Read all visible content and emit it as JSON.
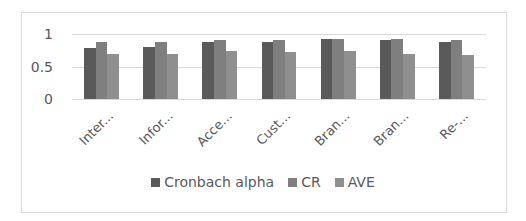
{
  "chart_data": {
    "type": "bar",
    "title": "",
    "xlabel": "",
    "ylabel": "",
    "ylim": [
      0,
      1
    ],
    "yticks": [
      "0",
      "0.5",
      "1"
    ],
    "grid": true,
    "legend_position": "bottom",
    "categories": [
      "Inter...",
      "Infor...",
      "Acce...",
      "Cust...",
      "Bran...",
      "Bran...",
      "Re-..."
    ],
    "series": [
      {
        "name": "Cronbach alpha",
        "color": "#5a5a5a",
        "values": [
          0.79,
          0.8,
          0.87,
          0.87,
          0.92,
          0.91,
          0.87
        ]
      },
      {
        "name": "CR",
        "color": "#7f7f7f",
        "values": [
          0.87,
          0.87,
          0.91,
          0.91,
          0.93,
          0.93,
          0.91
        ]
      },
      {
        "name": "AVE",
        "color": "#8f8f8f",
        "values": [
          0.7,
          0.7,
          0.74,
          0.72,
          0.74,
          0.69,
          0.67
        ]
      }
    ]
  },
  "legend": {
    "items": [
      {
        "label": "Cronbach alpha",
        "color": "#5a5a5a"
      },
      {
        "label": "CR",
        "color": "#7f7f7f"
      },
      {
        "label": "AVE",
        "color": "#8f8f8f"
      }
    ]
  }
}
